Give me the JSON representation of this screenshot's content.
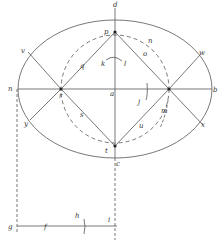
{
  "diagram": {
    "type": "geometric-construction",
    "colors": {
      "ink": "#555555",
      "label": "#333333",
      "background": "#ffffff"
    },
    "ellipse": {
      "cx": 115,
      "cy": 89,
      "rx": 97,
      "ry": 69
    },
    "circle": {
      "cx": 115,
      "cy": 89,
      "r": 54,
      "style": "dashed"
    },
    "labels": {
      "d": "d",
      "p": "p",
      "n": "n",
      "o": "o",
      "v": "v",
      "q": "q",
      "k": "k",
      "l": "l",
      "w": "w",
      "m": "m",
      "r": "r",
      "a": "a",
      "j": "j",
      "b": "b",
      "y": "y",
      "s": "s",
      "mm": "m",
      "u": "u",
      "x": "x",
      "t": "t",
      "c": "c",
      "g": "g",
      "f": "f",
      "h": "h",
      "i": "i"
    }
  }
}
